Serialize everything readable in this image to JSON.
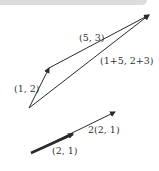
{
  "diagram": {
    "colors": {
      "line": "#2a2a2a",
      "label": "#333333",
      "topbar": "#dcdcdc"
    },
    "addition": {
      "vector_a_label": "(1, 2)",
      "vector_b_label": "(5, 3)",
      "sum_label": "(1+5, 2+3)"
    },
    "scaling": {
      "base_label": "(2, 1)",
      "scaled_label": "2(2, 1)"
    }
  }
}
